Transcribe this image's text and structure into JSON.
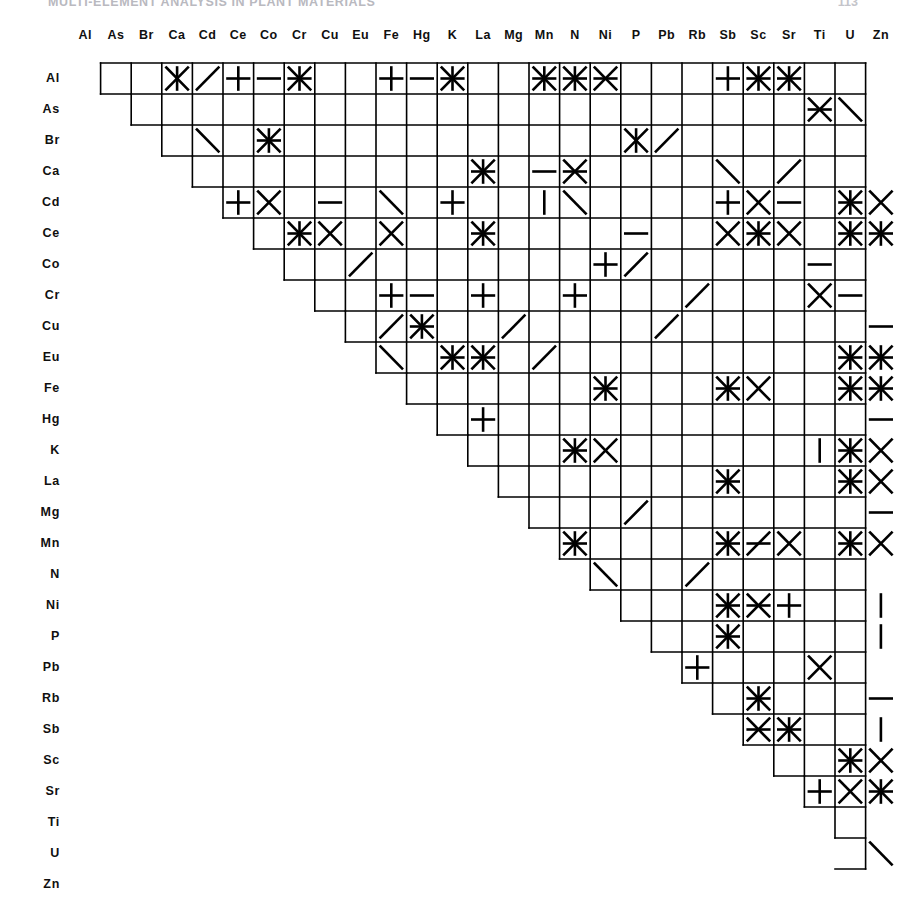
{
  "running_head": {
    "title": "MULTI-ELEMENT ANALYSIS IN PLANT MATERIALS",
    "page": "113"
  },
  "figure": {
    "name": "element-pair-matrix",
    "type": "upper-triangular pair matrix",
    "elements": [
      "Al",
      "As",
      "Br",
      "Ca",
      "Cd",
      "Ce",
      "Co",
      "Cr",
      "Cu",
      "Eu",
      "Fe",
      "Hg",
      "K",
      "La",
      "Mg",
      "Mn",
      "N",
      "Ni",
      "P",
      "Pb",
      "Rb",
      "Sb",
      "Sc",
      "Sr",
      "Ti",
      "U",
      "Zn"
    ],
    "columns": [
      "Al",
      "As",
      "Br",
      "Ca",
      "Cd",
      "Ce",
      "Co",
      "Cr",
      "Cu",
      "Eu",
      "Fe",
      "Hg",
      "K",
      "La",
      "Mg",
      "Mn",
      "N",
      "Ni",
      "P",
      "Pb",
      "Rb",
      "Sb",
      "Sc",
      "Sr",
      "Ti",
      "U",
      "Zn"
    ],
    "rows": [
      "Al",
      "As",
      "Br",
      "Ca",
      "Cd",
      "Ce",
      "Co",
      "Cr",
      "Cu",
      "Eu",
      "Fe",
      "Hg",
      "K",
      "La",
      "Mg",
      "Mn",
      "N",
      "Ni",
      "P",
      "Pb",
      "Rb",
      "Sb",
      "Sc",
      "Sr",
      "Ti",
      "U",
      "Zn"
    ],
    "geometry": {
      "grid_left": 70,
      "grid_top": 63,
      "cell_w": 30.6,
      "cell_h": 31.0,
      "n_cols": 26,
      "n_rows": 26,
      "col_label_y": 36,
      "row_label_x": 62
    },
    "stroke_color": "#000000",
    "grid_stroke_width": 1.6,
    "mark_stroke_width": 2.6,
    "mark_legend": {
      "star": "all four strokes: horizontal, vertical and both diagonals",
      "x": "both diagonals",
      "plus": "horizontal and vertical",
      "h": "horizontal stroke only",
      "v": "vertical stroke only",
      "d1": "diagonal from lower-left to upper-right",
      "d2": "diagonal from upper-left to lower-right",
      "hd2": "horizontal stroke and upper-left to lower-right diagonal",
      "hd1": "horizontal stroke and lower-left to upper-right diagonal",
      "xh": "both diagonals and horizontal stroke",
      "xv": "both diagonals and vertical stroke",
      "empty": "no mark"
    },
    "marks": [
      {
        "row": "Al",
        "cells": [
          [
            "Ca",
            "xv"
          ],
          [
            "Cd",
            "d1"
          ],
          [
            "Ce",
            "plus"
          ],
          [
            "Co",
            "h"
          ],
          [
            "Cr",
            "star"
          ],
          [
            "Fe",
            "plus"
          ],
          [
            "Hg",
            "h"
          ],
          [
            "K",
            "star"
          ],
          [
            "Mn",
            "star"
          ],
          [
            "N",
            "star"
          ],
          [
            "Ni",
            "xh"
          ],
          [
            "Sb",
            "plus"
          ],
          [
            "Sc",
            "star"
          ],
          [
            "Sr",
            "star"
          ]
        ]
      },
      {
        "row": "As",
        "cells": [
          [
            "Ti",
            "xh"
          ],
          [
            "U",
            "d2"
          ]
        ]
      },
      {
        "row": "Br",
        "cells": [
          [
            "Cd",
            "d2"
          ],
          [
            "Co",
            "star"
          ],
          [
            "P",
            "xv"
          ],
          [
            "Pb",
            "d1"
          ]
        ]
      },
      {
        "row": "Ca",
        "cells": [
          [
            "La",
            "star"
          ],
          [
            "Mn",
            "h"
          ],
          [
            "N",
            "xh"
          ],
          [
            "Sb",
            "d2"
          ],
          [
            "Sr",
            "d1"
          ]
        ]
      },
      {
        "row": "Cd",
        "cells": [
          [
            "Ce",
            "plus"
          ],
          [
            "Co",
            "x"
          ],
          [
            "Cu",
            "h"
          ],
          [
            "Fe",
            "d2"
          ],
          [
            "K",
            "plus"
          ],
          [
            "Mn",
            "v"
          ],
          [
            "N",
            "d2"
          ],
          [
            "Sb",
            "plus"
          ],
          [
            "Sc",
            "x"
          ],
          [
            "Sr",
            "h"
          ],
          [
            "U",
            "star"
          ],
          [
            "Zn",
            "x"
          ]
        ]
      },
      {
        "row": "Ce",
        "cells": [
          [
            "Cr",
            "star"
          ],
          [
            "Cu",
            "x"
          ],
          [
            "Fe",
            "x"
          ],
          [
            "La",
            "star"
          ],
          [
            "P",
            "h"
          ],
          [
            "Sb",
            "x"
          ],
          [
            "Sc",
            "star"
          ],
          [
            "Sr",
            "x"
          ],
          [
            "U",
            "star"
          ],
          [
            "Zn",
            "star"
          ]
        ]
      },
      {
        "row": "Co",
        "cells": [
          [
            "Eu",
            "d1"
          ],
          [
            "Ni",
            "plus"
          ],
          [
            "P",
            "d1"
          ],
          [
            "Ti",
            "h"
          ]
        ]
      },
      {
        "row": "Cr",
        "cells": [
          [
            "Fe",
            "plus"
          ],
          [
            "Hg",
            "h"
          ],
          [
            "La",
            "plus"
          ],
          [
            "N",
            "plus"
          ],
          [
            "Rb",
            "d1"
          ],
          [
            "Ti",
            "x"
          ],
          [
            "U",
            "h"
          ]
        ]
      },
      {
        "row": "Cu",
        "cells": [
          [
            "Fe",
            "d1"
          ],
          [
            "Hg",
            "star"
          ],
          [
            "Mg",
            "d1"
          ],
          [
            "Pb",
            "d1"
          ],
          [
            "Zn",
            "h"
          ]
        ]
      },
      {
        "row": "Eu",
        "cells": [
          [
            "Fe",
            "d2"
          ],
          [
            "K",
            "star"
          ],
          [
            "La",
            "star"
          ],
          [
            "Mn",
            "d1"
          ],
          [
            "U",
            "star"
          ],
          [
            "Zn",
            "star"
          ]
        ]
      },
      {
        "row": "Fe",
        "cells": [
          [
            "Ni",
            "star"
          ],
          [
            "Sb",
            "star"
          ],
          [
            "Sc",
            "x"
          ],
          [
            "U",
            "star"
          ],
          [
            "Zn",
            "star"
          ]
        ]
      },
      {
        "row": "Hg",
        "cells": [
          [
            "La",
            "plus"
          ],
          [
            "Zn",
            "h"
          ]
        ]
      },
      {
        "row": "K",
        "cells": [
          [
            "N",
            "star"
          ],
          [
            "Ni",
            "x"
          ],
          [
            "Ti",
            "v"
          ],
          [
            "U",
            "star"
          ],
          [
            "Zn",
            "x"
          ]
        ]
      },
      {
        "row": "La",
        "cells": [
          [
            "Sb",
            "star"
          ],
          [
            "U",
            "star"
          ],
          [
            "Zn",
            "x"
          ]
        ]
      },
      {
        "row": "Mg",
        "cells": [
          [
            "P",
            "d1"
          ],
          [
            "Zn",
            "h"
          ]
        ]
      },
      {
        "row": "Mn",
        "cells": [
          [
            "N",
            "star"
          ],
          [
            "Sb",
            "star"
          ],
          [
            "Sc",
            "hd1"
          ],
          [
            "Sr",
            "x"
          ],
          [
            "U",
            "star"
          ],
          [
            "Zn",
            "x"
          ]
        ]
      },
      {
        "row": "N",
        "cells": [
          [
            "Ni",
            "d2"
          ],
          [
            "Rb",
            "d1"
          ]
        ]
      },
      {
        "row": "Ni",
        "cells": [
          [
            "Sb",
            "star"
          ],
          [
            "Sc",
            "xh"
          ],
          [
            "Sr",
            "plus"
          ],
          [
            "Zn",
            "v"
          ]
        ]
      },
      {
        "row": "P",
        "cells": [
          [
            "Sb",
            "star"
          ],
          [
            "Zn",
            "v"
          ]
        ]
      },
      {
        "row": "Pb",
        "cells": [
          [
            "Rb",
            "plus"
          ],
          [
            "Ti",
            "x"
          ]
        ]
      },
      {
        "row": "Rb",
        "cells": [
          [
            "Sc",
            "star"
          ],
          [
            "Zn",
            "h"
          ]
        ]
      },
      {
        "row": "Sb",
        "cells": [
          [
            "Sc",
            "xh"
          ],
          [
            "Sr",
            "star"
          ],
          [
            "Zn",
            "v"
          ]
        ]
      },
      {
        "row": "Sc",
        "cells": [
          [
            "U",
            "star"
          ],
          [
            "Zn",
            "x"
          ]
        ]
      },
      {
        "row": "Sr",
        "cells": [
          [
            "Ti",
            "plus"
          ],
          [
            "U",
            "x"
          ],
          [
            "Zn",
            "star"
          ]
        ]
      },
      {
        "row": "Ti",
        "cells": []
      },
      {
        "row": "U",
        "cells": [
          [
            "Zn",
            "d2"
          ]
        ]
      },
      {
        "row": "Zn",
        "cells": []
      }
    ],
    "outline_note": "staircase outline: row i spans columns i+1..26, drawn as a stepped upper-triangular frame"
  }
}
